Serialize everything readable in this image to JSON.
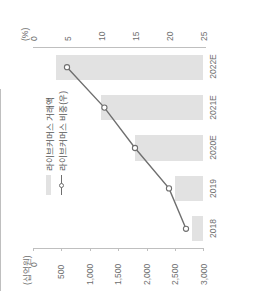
{
  "chart_data": {
    "type": "bar",
    "title": "",
    "categories": [
      "2018",
      "2019",
      "2020E",
      "2021E",
      "2022E"
    ],
    "series": [
      {
        "name": "라이브커머스 거래액",
        "type": "bar",
        "axis": "left",
        "values": [
          200,
          500,
          1200,
          1800,
          2600
        ],
        "color": "#e2e2e2"
      },
      {
        "name": "라이브커머스 비중(우)",
        "type": "line",
        "axis": "right",
        "values": [
          2.5,
          5.0,
          10.0,
          14.5,
          20.0
        ],
        "color": "#6f6f6f"
      }
    ],
    "xlabel": "",
    "ylabel": "(십억원)",
    "y2label": "(%)",
    "ylim": [
      0,
      3000
    ],
    "y2lim": [
      0,
      25
    ],
    "yticks": [
      "0",
      "500",
      "1,000",
      "1,500",
      "2,000",
      "2,500",
      "3,000"
    ],
    "y2ticks": [
      "0",
      "5",
      "10",
      "15",
      "20",
      "25"
    ],
    "grid": false,
    "legend_position": "upper-left",
    "orientation": "rotated-90-ccw"
  },
  "axes": {
    "left_unit": "(십억원)",
    "right_unit": "(%)",
    "left_ticks": [
      "0",
      "500",
      "1,000",
      "1,500",
      "2,000",
      "2,500",
      "3,000"
    ],
    "right_ticks": [
      "0",
      "5",
      "10",
      "15",
      "20",
      "25"
    ],
    "categories": [
      "2018",
      "2019",
      "2020E",
      "2021E",
      "2022E"
    ]
  },
  "legend": {
    "items": [
      {
        "label": "라이브커머스 거래액"
      },
      {
        "label": "라이브커머스 비중(우)"
      }
    ]
  }
}
